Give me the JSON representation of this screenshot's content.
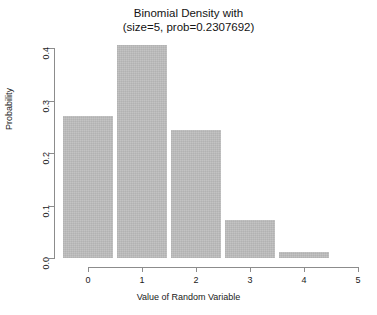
{
  "chart_data": {
    "type": "bar",
    "title": "Binomial Density with\n(size=5, prob=0.2307692)",
    "title_line1": "Binomial Density with",
    "title_line2": "(size=5, prob=0.2307692)",
    "xlabel": "Value of Random Variable",
    "ylabel": "Probability",
    "categories": [
      "0",
      "1",
      "2",
      "3",
      "4"
    ],
    "x": [
      0,
      1,
      2,
      3,
      4
    ],
    "values": [
      0.2707,
      0.4061,
      0.2436,
      0.0731,
      0.011
    ],
    "xlim": [
      0,
      5
    ],
    "ylim": [
      0.0,
      0.4
    ],
    "xticks": [
      "0",
      "1",
      "2",
      "3",
      "4",
      "5"
    ],
    "xtick_values": [
      0,
      1,
      2,
      3,
      4,
      5
    ],
    "yticks": [
      "0.0",
      "0.1",
      "0.2",
      "0.3",
      "0.4"
    ],
    "ytick_values": [
      0.0,
      0.1,
      0.2,
      0.3,
      0.4
    ],
    "grid": false,
    "legend": false,
    "bar_color": "#bfbfbf",
    "axis_color": "#8c8c8c",
    "background": "#ffffff",
    "distribution": {
      "name": "binomial",
      "size": 5,
      "prob": 0.2307692
    }
  }
}
